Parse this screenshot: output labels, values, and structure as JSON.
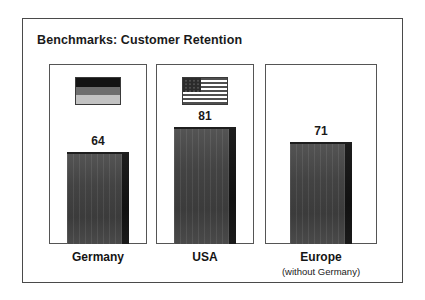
{
  "chart_data": {
    "type": "bar",
    "title": "Benchmarks: Customer Retention",
    "categories": [
      "Germany",
      "USA",
      "Europe"
    ],
    "values": [
      64,
      81,
      71
    ],
    "xlabel": "",
    "ylabel": "",
    "ylim": [
      0,
      100
    ],
    "grid": false,
    "legend": null,
    "annotations": [
      {
        "category": "Europe",
        "text": "(without Germany)"
      }
    ],
    "series": [
      {
        "name": "Customer Retention",
        "values": [
          64,
          81,
          71
        ]
      }
    ],
    "data_labels": [
      "64",
      "81",
      "71"
    ],
    "bars": [
      {
        "category": "Germany",
        "sublabel": "",
        "value": 64,
        "value_label": "64",
        "flag": "german-flag",
        "flag_bands": [
          "#141414",
          "#6e6e6e",
          "#c2c2c2"
        ]
      },
      {
        "category": "USA",
        "sublabel": "",
        "value": 81,
        "value_label": "81",
        "flag": "usa-flag",
        "flag_bands": []
      },
      {
        "category": "Europe",
        "sublabel": "(without Germany)",
        "value": 71,
        "value_label": "71",
        "flag": null,
        "flag_bands": []
      }
    ]
  },
  "colors": {
    "frame_border": "#4a4a4a",
    "panel_border": "#555555",
    "bar_fill": "#434343",
    "bar_shadow": "#141414",
    "text": "#1a1a1a",
    "background": "#ffffff"
  }
}
